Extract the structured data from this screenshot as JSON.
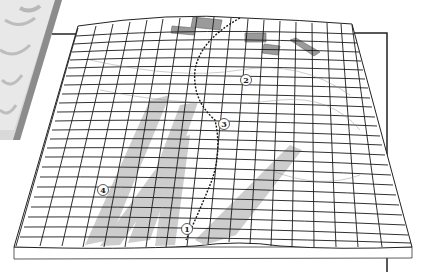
{
  "diagram": {
    "type": "3d-deformed-grid-block",
    "markers": [
      {
        "id": "1",
        "label": "1",
        "x": 187,
        "y": 229
      },
      {
        "id": "2",
        "label": "2",
        "x": 246,
        "y": 80
      },
      {
        "id": "3",
        "label": "3",
        "x": 224,
        "y": 124
      },
      {
        "id": "4",
        "label": "4",
        "x": 103,
        "y": 190
      }
    ],
    "colors": {
      "grid_line": "#1a1a1a",
      "band_fill": "#c8c8c8",
      "patch_fill": "#9a9a9a",
      "frame_line": "#222222",
      "photo_edge": "#8c8c8c"
    },
    "features": {
      "fault_line": "dotted curve from top-center down to marker 1",
      "shaded_bands": 5,
      "rectangular_patches": 5,
      "background_frame": "rectangle behind block, top-left and right edge"
    }
  }
}
